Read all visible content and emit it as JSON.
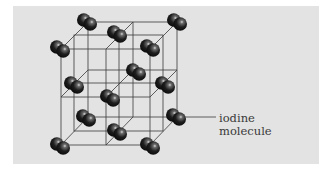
{
  "figure": {
    "type": "crystal-lattice-diagram",
    "labels": [
      {
        "id": "iodine-molecule",
        "lines": [
          "iodine",
          "molecule"
        ]
      }
    ],
    "colors": {
      "background": "#ffffff",
      "panel": "#e3e3e3",
      "lines": "#3a3a3a",
      "molecule": "#1a1a1a",
      "highlight": "#cfcfcf",
      "label_text": "#3a3a3a"
    },
    "molecule_count": 14
  }
}
